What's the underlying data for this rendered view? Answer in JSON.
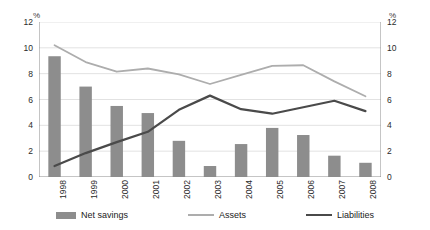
{
  "chart_data": {
    "type": "bar",
    "title": "",
    "xlabel": "",
    "ylabel": "%",
    "ylabel_right": "%",
    "ylim": [
      0,
      12
    ],
    "yticks": [
      0,
      2,
      4,
      6,
      8,
      10,
      12
    ],
    "yticks_right": [
      0,
      2,
      4,
      6,
      8,
      10,
      12
    ],
    "grid": true,
    "legend_position": "bottom",
    "categories": [
      "1998",
      "1999",
      "2000",
      "2001",
      "2002",
      "2003",
      "2004",
      "2005",
      "2006",
      "2007",
      "2008"
    ],
    "series": [
      {
        "name": "Net savings",
        "type": "bar",
        "color": "#8d8d8d",
        "values": [
          9.35,
          7.0,
          5.5,
          4.95,
          2.8,
          0.85,
          2.55,
          3.8,
          3.25,
          1.65,
          1.1
        ]
      },
      {
        "name": "Assets",
        "type": "line",
        "color": "#adadad",
        "values": [
          10.2,
          8.9,
          8.15,
          8.4,
          7.95,
          7.2,
          7.9,
          8.6,
          8.65,
          7.4,
          6.25
        ]
      },
      {
        "name": "Liabilities",
        "type": "line",
        "color": "#4a4a4a",
        "values": [
          0.85,
          1.85,
          2.7,
          3.5,
          5.2,
          6.3,
          5.25,
          4.9,
          5.4,
          5.9,
          5.1
        ]
      }
    ]
  },
  "axes": {
    "unit_left": "%",
    "unit_right": "%"
  },
  "legend": {
    "items": [
      {
        "label": "Net savings"
      },
      {
        "label": "Assets"
      },
      {
        "label": "Liabilities"
      }
    ]
  },
  "colors": {
    "bar": "#8d8d8d",
    "assets_line": "#adadad",
    "liabilities_line": "#4a4a4a",
    "grid": "#e2e2e2",
    "axis": "#8a8a8a",
    "text": "#2b2b2b"
  }
}
